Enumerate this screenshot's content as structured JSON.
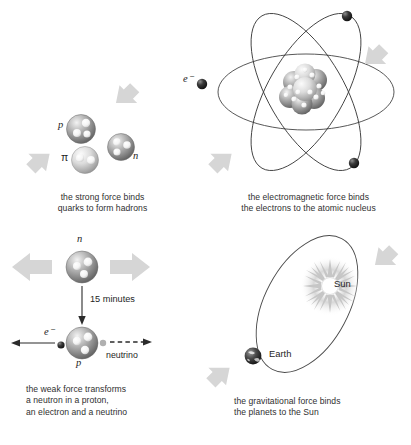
{
  "figure": {
    "panels": [
      {
        "id": "strong-force",
        "caption": "the strong force binds\nquarks to form hadrons",
        "particles": [
          {
            "label": "p",
            "name": "proton",
            "quarks": 3
          },
          {
            "label": "n",
            "name": "neutron",
            "quarks": 3
          },
          {
            "label": "π",
            "name": "pion",
            "quarks": 2
          }
        ],
        "arrows": 2
      },
      {
        "id": "electromagnetic-force",
        "caption": "the electromagnetic force binds\nthe electrons to the atomic nucleus",
        "electron_label": "e⁻",
        "orbits": 3,
        "electrons": 3,
        "arrows": 2
      },
      {
        "id": "weak-force",
        "caption": "the weak force transforms\na neutron in a proton,\nan electron and a neutrino",
        "neutron_label": "n",
        "proton_label": "p",
        "electron_label": "e⁻",
        "neutrino_label": "neutrino",
        "decay_time": "15 minutes",
        "arrows": 2
      },
      {
        "id": "gravitational-force",
        "caption": "the gravitational  force binds\nthe planets to the Sun",
        "sun_label": "Sun",
        "earth_label": "Earth",
        "arrows": 2
      }
    ]
  },
  "colors": {
    "arrow_gray": "#d4d4d4",
    "sphere_gray": "#8a8a8a",
    "sphere_light": "#e6e6e6",
    "orbit_line": "#3a3a3a",
    "text": "#2f2f2f",
    "electron_dark": "#1a1a1a",
    "sun_glow": "#bdbdbd"
  }
}
